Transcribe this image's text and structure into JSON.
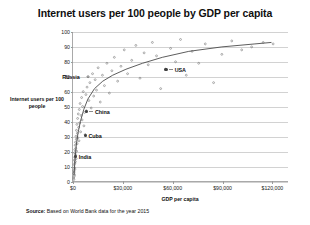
{
  "chart_data": {
    "type": "scatter",
    "title": "Internet users per 100 people by GDP per capita",
    "xlabel": "GDP per capita",
    "ylabel": "Internet users per 100 people",
    "source": "Source: Based on World Bank data for the year 2015",
    "source_lead": "Source:",
    "source_rest": " Based on World Bank data for the year 2015",
    "grid": "horizontal",
    "legend": "none",
    "xlim": [
      0,
      130000
    ],
    "ylim": [
      0,
      100
    ],
    "xticks": [
      0,
      30000,
      60000,
      90000,
      120000
    ],
    "xtick_labels": [
      "$0",
      "$30,000",
      "$60,000",
      "$90,000",
      "$120,000"
    ],
    "yticks": [
      0,
      10,
      20,
      30,
      40,
      50,
      60,
      70,
      80,
      90,
      100
    ],
    "ytick_labels": [
      "0",
      "10",
      "20",
      "30",
      "40",
      "50",
      "60",
      "70",
      "80",
      "90",
      "100"
    ],
    "trend": {
      "type": "logarithmic",
      "label": "logarithmic trend line",
      "points": [
        [
          600,
          4
        ],
        [
          1200,
          14
        ],
        [
          2000,
          24
        ],
        [
          3000,
          32
        ],
        [
          4500,
          40
        ],
        [
          6500,
          48
        ],
        [
          9000,
          55
        ],
        [
          13000,
          62
        ],
        [
          18000,
          67
        ],
        [
          24000,
          71
        ],
        [
          32000,
          75
        ],
        [
          42000,
          79
        ],
        [
          54000,
          83
        ],
        [
          70000,
          87
        ],
        [
          90000,
          90
        ],
        [
          110000,
          92
        ],
        [
          120000,
          93
        ]
      ]
    },
    "annotated_points": [
      {
        "name": "USA",
        "x": 56000,
        "y": 75
      },
      {
        "name": "Russia",
        "x": 9100,
        "y": 70
      },
      {
        "name": "China",
        "x": 8000,
        "y": 47
      },
      {
        "name": "Cuba",
        "x": 7400,
        "y": 31
      },
      {
        "name": "India",
        "x": 1600,
        "y": 17
      }
    ],
    "points": [
      [
        380,
        2
      ],
      [
        450,
        5
      ],
      [
        520,
        1
      ],
      [
        600,
        7
      ],
      [
        640,
        3
      ],
      [
        700,
        11
      ],
      [
        760,
        6
      ],
      [
        800,
        14
      ],
      [
        860,
        9
      ],
      [
        900,
        19
      ],
      [
        960,
        4
      ],
      [
        1000,
        16
      ],
      [
        1080,
        21
      ],
      [
        1150,
        12
      ],
      [
        1200,
        8
      ],
      [
        1280,
        24
      ],
      [
        1350,
        18
      ],
      [
        1420,
        13
      ],
      [
        1500,
        26
      ],
      [
        1600,
        17
      ],
      [
        1700,
        22
      ],
      [
        1800,
        30
      ],
      [
        1900,
        15
      ],
      [
        2000,
        28
      ],
      [
        2100,
        34
      ],
      [
        2200,
        20
      ],
      [
        2350,
        38
      ],
      [
        2500,
        25
      ],
      [
        2650,
        32
      ],
      [
        2800,
        42
      ],
      [
        3000,
        29
      ],
      [
        3200,
        45
      ],
      [
        3400,
        36
      ],
      [
        3600,
        27
      ],
      [
        3800,
        48
      ],
      [
        4000,
        39
      ],
      [
        4300,
        52
      ],
      [
        4600,
        33
      ],
      [
        4900,
        44
      ],
      [
        5200,
        56
      ],
      [
        5500,
        41
      ],
      [
        5800,
        50
      ],
      [
        6200,
        60
      ],
      [
        6600,
        37
      ],
      [
        7000,
        46
      ],
      [
        7400,
        31
      ],
      [
        7800,
        58
      ],
      [
        8000,
        47
      ],
      [
        8500,
        63
      ],
      [
        9100,
        70
      ],
      [
        9600,
        54
      ],
      [
        10200,
        66
      ],
      [
        11000,
        49
      ],
      [
        11800,
        72
      ],
      [
        12500,
        57
      ],
      [
        13400,
        68
      ],
      [
        14200,
        61
      ],
      [
        15200,
        76
      ],
      [
        16500,
        53
      ],
      [
        17800,
        71
      ],
      [
        19000,
        64
      ],
      [
        20500,
        79
      ],
      [
        22000,
        59
      ],
      [
        23500,
        74
      ],
      [
        25000,
        83
      ],
      [
        27000,
        67
      ],
      [
        29000,
        77
      ],
      [
        31000,
        88
      ],
      [
        33000,
        72
      ],
      [
        35500,
        81
      ],
      [
        38000,
        91
      ],
      [
        40500,
        69
      ],
      [
        43000,
        86
      ],
      [
        45500,
        78
      ],
      [
        48000,
        93
      ],
      [
        50500,
        84
      ],
      [
        53000,
        62
      ],
      [
        56000,
        75
      ],
      [
        59000,
        89
      ],
      [
        62000,
        80
      ],
      [
        65000,
        95
      ],
      [
        68500,
        71
      ],
      [
        72000,
        87
      ],
      [
        76000,
        79
      ],
      [
        80000,
        92
      ],
      [
        85000,
        66
      ],
      [
        90000,
        85
      ],
      [
        96000,
        94
      ],
      [
        102000,
        88
      ],
      [
        108000,
        90
      ],
      [
        115000,
        93
      ],
      [
        121000,
        92
      ]
    ]
  }
}
